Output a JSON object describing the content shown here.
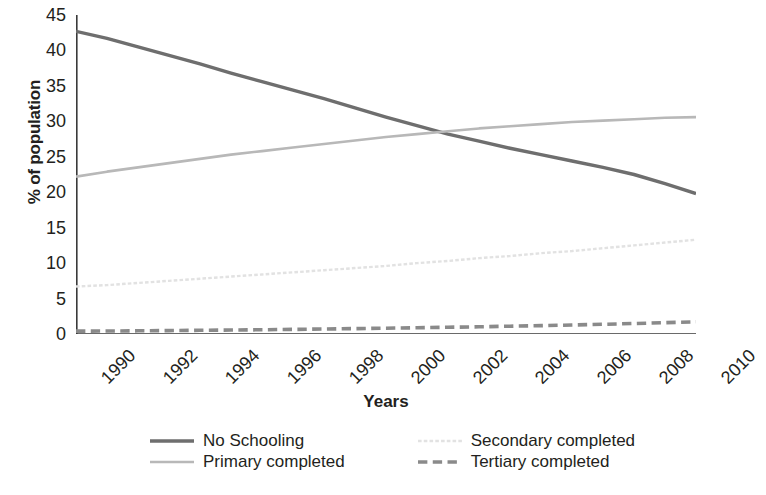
{
  "chart_data": {
    "type": "line",
    "title": "",
    "xlabel": "Years",
    "ylabel": "% of population",
    "x": [
      1990,
      1991,
      1992,
      1993,
      1994,
      1995,
      1996,
      1997,
      1998,
      1999,
      2000,
      2001,
      2002,
      2003,
      2004,
      2005,
      2006,
      2007,
      2008,
      2009,
      2010
    ],
    "xlim": [
      1990,
      2010
    ],
    "ylim": [
      0,
      45
    ],
    "xticks": [
      "1990",
      "1992",
      "1994",
      "1996",
      "1998",
      "2000",
      "2002",
      "2004",
      "2006",
      "2008",
      "2010"
    ],
    "xtick_values": [
      1990,
      1992,
      1994,
      1996,
      1998,
      2000,
      2002,
      2004,
      2006,
      2008,
      2010
    ],
    "yticks": [
      "0",
      "5",
      "10",
      "15",
      "20",
      "25",
      "30",
      "35",
      "40",
      "45"
    ],
    "ytick_values": [
      0,
      5,
      10,
      15,
      20,
      25,
      30,
      35,
      40,
      45
    ],
    "grid": false,
    "legend_position": "bottom",
    "series": [
      {
        "name": "No Schooling",
        "color": "#6e6e6e",
        "style": "solid",
        "width": 3.4,
        "values": [
          42.7,
          41.7,
          40.5,
          39.3,
          38.1,
          36.8,
          35.6,
          34.4,
          33.2,
          31.9,
          30.6,
          29.4,
          28.2,
          27.2,
          26.2,
          25.3,
          24.4,
          23.5,
          22.5,
          21.2,
          19.8
        ]
      },
      {
        "name": "Primary completed",
        "color": "#b8b8b8",
        "style": "solid",
        "width": 2.6,
        "values": [
          22.2,
          22.9,
          23.5,
          24.1,
          24.7,
          25.3,
          25.8,
          26.3,
          26.8,
          27.3,
          27.8,
          28.2,
          28.6,
          29.0,
          29.3,
          29.6,
          29.9,
          30.1,
          30.3,
          30.5,
          30.6
        ]
      },
      {
        "name": "Secondary completed",
        "color": "#e2e2e2",
        "style": "dotted",
        "width": 2.4,
        "values": [
          6.7,
          6.9,
          7.2,
          7.5,
          7.8,
          8.1,
          8.4,
          8.7,
          9.0,
          9.3,
          9.6,
          10.0,
          10.3,
          10.7,
          11.0,
          11.4,
          11.7,
          12.1,
          12.5,
          12.9,
          13.3
        ]
      },
      {
        "name": "Tertiary completed",
        "color": "#8a8a8a",
        "style": "dashed",
        "width": 3.6,
        "values": [
          0.4,
          0.42,
          0.45,
          0.48,
          0.52,
          0.56,
          0.6,
          0.65,
          0.7,
          0.76,
          0.82,
          0.88,
          0.95,
          1.02,
          1.1,
          1.18,
          1.27,
          1.37,
          1.48,
          1.6,
          1.72
        ]
      }
    ],
    "annotations": []
  },
  "axes": {
    "axis_color": "#3a3a3a",
    "tick_length": 7
  },
  "legend": {
    "items": [
      {
        "label": "No Schooling",
        "swatch": "solid-dark-line-swatch"
      },
      {
        "label": "Secondary completed",
        "swatch": "dotted-light-line-swatch"
      },
      {
        "label": "Primary completed",
        "swatch": "solid-light-line-swatch"
      },
      {
        "label": "Tertiary completed",
        "swatch": "dashed-gray-line-swatch"
      }
    ]
  }
}
